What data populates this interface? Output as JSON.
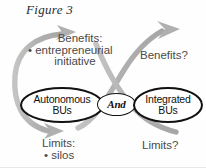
{
  "figure": {
    "title": "Figure 3",
    "colors": {
      "arrow": "#b4b4b4",
      "arrow_dark": "#9c9c9c",
      "oval_border": "#111111",
      "oval_fill": "#ffffff",
      "label_text": "#4a4a4a",
      "title_text": "#2b2b2b",
      "background": "#fefefe"
    }
  },
  "nodes": {
    "autonomous": {
      "line1": "Autonomous",
      "line2": "BUs"
    },
    "connector": {
      "label": "And"
    },
    "integrated": {
      "line1": "Integrated",
      "line2": "BUs"
    }
  },
  "labels": {
    "benefits_left": {
      "line1": "Benefits:",
      "line2": "• entrepreneurial",
      "line3": "initiative"
    },
    "benefits_right": {
      "line1": "Benefits?"
    },
    "limits_left": {
      "line1": "Limits:",
      "line2": "• silos"
    },
    "limits_right": {
      "line1": "Limits?"
    }
  },
  "arrows": [
    {
      "name": "left-feedback-loop",
      "description": "large gray C-shaped loop on the left wrapping the Autonomous BUs oval, arrowhead at top pointing up-right"
    },
    {
      "name": "left-loop-bottom-arrow",
      "description": "bottom of the left loop sweeping right with an arrowhead pointing right toward Limits"
    },
    {
      "name": "cross-arrow-up-right",
      "description": "gray curve from lower-left rising through the center crossing to the upper right, arrowhead pointing up-right toward Benefits?"
    },
    {
      "name": "cross-arrow-down-right",
      "description": "gray curve from upper-left descending through the center crossing to the lower right toward Limits?"
    }
  ]
}
